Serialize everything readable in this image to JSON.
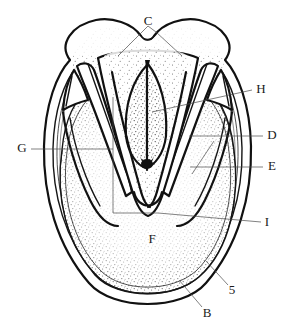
{
  "figure": {
    "background_color": "#ffffff",
    "ink_color": "#111111",
    "leader_color": "#4a4a4a",
    "width": 295,
    "height": 331
  },
  "labels": [
    {
      "id": "C",
      "text": "C",
      "part": "bulbs-of-the-heel",
      "x": 148,
      "y": 22,
      "leader_type": "forked",
      "leader_points": [
        [
          137,
          57
        ],
        [
          148,
          33
        ],
        [
          159,
          57
        ]
      ],
      "leader_branches": [
        [
          [
            142,
            32
          ],
          [
            118,
            56
          ]
        ],
        [
          [
            156,
            32
          ],
          [
            182,
            56
          ]
        ]
      ]
    },
    {
      "id": "H",
      "text": "H",
      "part": "central-sulcus-of-frog",
      "x": 261,
      "y": 90,
      "leader_type": "straight",
      "leader_points": [
        [
          253,
          90
        ],
        [
          152,
          111
        ]
      ]
    },
    {
      "id": "D",
      "text": "D",
      "part": "bar",
      "x": 272,
      "y": 136,
      "leader_type": "straight",
      "leader_points": [
        [
          264,
          136
        ],
        [
          190,
          136
        ]
      ]
    },
    {
      "id": "E",
      "text": "E",
      "part": "collateral-groove",
      "x": 272,
      "y": 167,
      "leader_type": "straight",
      "leader_points": [
        [
          264,
          167
        ],
        [
          193,
          167
        ],
        [
          192,
          167
        ],
        [
          193,
          166
        ]
      ]
    },
    {
      "id": "E2",
      "text": "",
      "part": "collateral-groove-diagonal",
      "leader_type": "diagonal",
      "leader_points": [
        [
          214,
          140
        ],
        [
          192,
          172
        ]
      ]
    },
    {
      "id": "G",
      "text": "G",
      "part": "angle-of-the-wall",
      "x": 22,
      "y": 149,
      "leader_type": "bracket",
      "leader_points": [
        [
          31,
          149
        ],
        [
          113,
          149
        ]
      ],
      "bracket_points": [
        [
          113,
          96
        ],
        [
          113,
          213
        ],
        [
          158,
          213
        ]
      ]
    },
    {
      "id": "I",
      "text": "I",
      "part": "apex-of-frog",
      "x": 267,
      "y": 223,
      "leader_type": "straight",
      "leader_points": [
        [
          262,
          223
        ],
        [
          158,
          213
        ]
      ]
    },
    {
      "id": "F",
      "text": "F",
      "part": "sole",
      "x": 152,
      "y": 240,
      "leader_type": "none",
      "leader_points": []
    },
    {
      "id": "5",
      "text": "5",
      "part": "white-line",
      "x": 232,
      "y": 291,
      "leader_type": "straight",
      "leader_points": [
        [
          228,
          285
        ],
        [
          207,
          262
        ]
      ]
    },
    {
      "id": "B",
      "text": "B",
      "part": "hoof-wall",
      "x": 207,
      "y": 314,
      "leader_type": "straight",
      "leader_points": [
        [
          203,
          307
        ],
        [
          180,
          281
        ]
      ]
    }
  ],
  "anatomy_notes": {
    "outer_wall": "hoof-wall-outer-border",
    "white_line": "white-line-concentric-band",
    "sole": "stippled-sole-region",
    "frog": "central-v-shaped-frog",
    "central_sulcus": "lens-shaped-cleft-of-frog",
    "bars": "paired-bars-flanking-frog",
    "bulbs": "paired-heel-bulbs-at-top"
  }
}
